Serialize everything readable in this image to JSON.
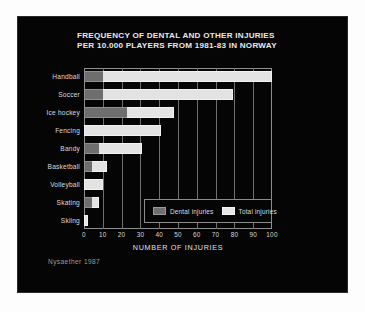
{
  "credit": "Nysaether 1987",
  "legend": {
    "items": [
      {
        "label": "Dental injuries",
        "swatch": "dental",
        "color": "#6e6e6e"
      },
      {
        "label": "Total injuries",
        "swatch": "total",
        "color": "#e6e6e6"
      }
    ]
  },
  "chart_data": {
    "type": "bar",
    "orientation": "horizontal",
    "title": "FREQUENCY OF DENTAL AND OTHER INJURIES PER 10.000 PLAYERS FROM 1981-83 IN NORWAY",
    "title_lines": [
      "FREQUENCY OF DENTAL AND OTHER INJURIES",
      "PER 10.000 PLAYERS FROM 1981-83 IN NORWAY"
    ],
    "xlabel": "NUMBER OF INJURIES",
    "ylabel": "",
    "xlim": [
      0,
      100
    ],
    "xticks": [
      0,
      10,
      20,
      30,
      40,
      50,
      60,
      70,
      80,
      90,
      100
    ],
    "grid": "vertical",
    "legend_position": "inside-bottom-right",
    "categories": [
      "Handball",
      "Soccer",
      "Ice hockey",
      "Fencing",
      "Bandy",
      "Basketball",
      "Volleyball",
      "Skating",
      "Skiing"
    ],
    "series": [
      {
        "name": "Dental injuries",
        "color": "#6e6e6e",
        "values": [
          10,
          10,
          23,
          0,
          8,
          4,
          0,
          4,
          0
        ]
      },
      {
        "name": "Total injuries",
        "color": "#e3e3e3",
        "values": [
          100,
          79,
          48,
          41,
          31,
          12,
          10,
          8,
          2
        ]
      }
    ]
  }
}
